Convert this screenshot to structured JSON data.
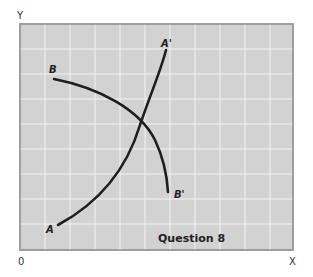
{
  "diagram": {
    "y_axis_label": "Y",
    "x_axis_label": "X",
    "origin_label": "0",
    "caption": "Question 8",
    "colors": {
      "plot_background": "#d2d2d2",
      "gridline": "#f2f2f2",
      "frame": "#9a9a9a",
      "curve": "#1e1e1e"
    },
    "curves": [
      {
        "name": "AA'",
        "start_label": "A",
        "end_label": "A'",
        "shape": "upward-sloping, convex"
      },
      {
        "name": "BB'",
        "start_label": "B",
        "end_label": "B'",
        "shape": "downward-sloping, concave"
      }
    ]
  }
}
